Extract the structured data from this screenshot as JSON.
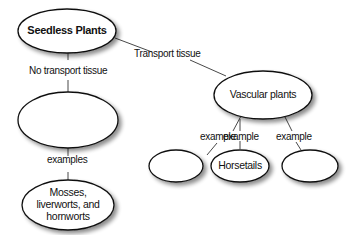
{
  "diagram": {
    "type": "concept-map",
    "nodes": {
      "root": {
        "label": "Seedless Plants"
      },
      "nonvascular": {
        "label": ""
      },
      "mosses": {
        "label_lines": [
          "Mosses,",
          "liverworts, and",
          "hornworts"
        ]
      },
      "vascular": {
        "label": "Vascular plants"
      },
      "example_left": {
        "label": ""
      },
      "horsetails": {
        "label": "Horsetails"
      },
      "example_right": {
        "label": ""
      }
    },
    "links": {
      "transport": "Transport tissue",
      "no_transport": "No transport tissue",
      "examples": "examples",
      "example_1": "example",
      "example_2": "example",
      "example_3": "example"
    }
  }
}
